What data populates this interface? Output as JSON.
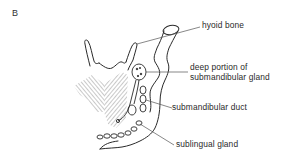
{
  "figure": {
    "panel_letter": "B",
    "labels": {
      "hyoid_bone": "hyoid bone",
      "deep_portion_line1": "deep portion of",
      "deep_portion_line2": "submandibular gland",
      "submandibular_duct": "submandibular duct",
      "sublingual_gland": "sublingual gland"
    },
    "colors": {
      "line": "#2a2a2a",
      "leader": "#555555",
      "hatch": "#777777",
      "background": "#ffffff"
    }
  }
}
